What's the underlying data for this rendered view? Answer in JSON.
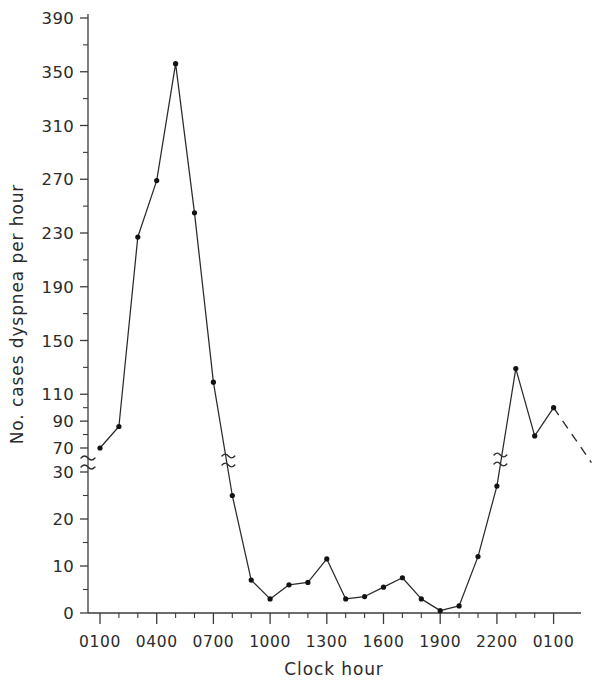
{
  "chart_data": {
    "type": "line",
    "title": "",
    "xlabel": "Clock hour",
    "ylabel": "No. cases dyspnea per hour",
    "grid": false,
    "legend": null,
    "axis_break": {
      "present": true,
      "between": [
        30,
        70
      ],
      "note": "y-axis has a broken scale; lower segment 0-30 linear, upper segment 70-390 linear"
    },
    "ylim_lower": [
      0,
      30
    ],
    "ylim_upper": [
      70,
      390
    ],
    "ytick_labels_upper": [
      "390",
      "350",
      "310",
      "270",
      "230",
      "190",
      "150",
      "110",
      "90",
      "70"
    ],
    "ytick_values_upper": [
      390,
      350,
      310,
      270,
      230,
      190,
      150,
      110,
      90,
      70
    ],
    "ytick_labels_lower": [
      "30",
      "20",
      "10",
      "0"
    ],
    "ytick_values_lower": [
      30,
      20,
      10,
      0
    ],
    "xtick_labels": [
      "0100",
      "0400",
      "0700",
      "1000",
      "1300",
      "1600",
      "1900",
      "2200",
      "0100"
    ],
    "x_categories": [
      "0100",
      "0200",
      "0300",
      "0400",
      "0500",
      "0600",
      "0700",
      "0800",
      "0900",
      "1000",
      "1100",
      "1200",
      "1300",
      "1400",
      "1500",
      "1600",
      "1700",
      "1800",
      "1900",
      "2000",
      "2100",
      "2200",
      "2300",
      "2400",
      "0100"
    ],
    "values": [
      70,
      86,
      227,
      269,
      356,
      245,
      119,
      25,
      7,
      3,
      6,
      6.5,
      11.5,
      3,
      3.5,
      5.5,
      7.5,
      3,
      0.5,
      1.5,
      12,
      27,
      52,
      79,
      100
    ],
    "dashed_tail": {
      "from_index": 24,
      "from_value": 100,
      "to_value": 32,
      "note": "final descending segment drawn dashed past the last plotted point"
    },
    "series_name": "Cases of dyspnea per hour"
  },
  "axis": {
    "x_title": "Clock hour",
    "y_title": "No. cases dyspnea per hour"
  }
}
